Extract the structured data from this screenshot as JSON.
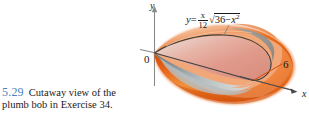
{
  "figure": {
    "width": 309,
    "height": 122,
    "background": "#ffffff",
    "caption": {
      "number": "5.29",
      "number_color": "#4b82b8",
      "text": "Cutaway view of the plumb bob in Exercise 34."
    }
  },
  "axes": {
    "y_label": "y",
    "x_label": "x",
    "origin_label": "0",
    "axis_color": "#808080"
  },
  "annotations": {
    "equation": {
      "lhs": "y",
      "equals": "=",
      "frac_numerator": "x",
      "frac_denominator": "12",
      "radical_sign": "√",
      "radicand_a": "36",
      "radicand_minus": "−",
      "radicand_b": "x",
      "radicand_b_exp": "2",
      "full_text": "y = (x/12)√(36 − x²)"
    },
    "radius_label": "6"
  },
  "solid": {
    "name": "plumb-bob solid of revolution",
    "outer_color": "#e8600f",
    "outer_highlight": "#f5a06a",
    "outer_shadow": "#c2450a",
    "cut_face_upper": "#e8a99e",
    "cut_face_upper_light": "#f2ddd8",
    "cut_face_lower": "#8e9699",
    "cut_face_lower_light": "#c9d0d2",
    "edge_color": "#4a4a4a"
  }
}
